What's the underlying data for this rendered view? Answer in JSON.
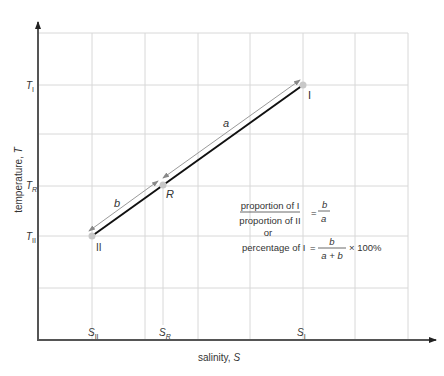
{
  "diagram": {
    "type": "TS mixing diagram",
    "x_axis_label": "salinity, ",
    "x_axis_symbol": "S",
    "y_axis_label": "temperature, ",
    "y_axis_symbol": "T",
    "colors": {
      "axis": "#555555",
      "grid": "#d8d8d8",
      "mixing_line": "#111111",
      "dimension_line": "#9a9a9a",
      "text": "#333333",
      "point": "#bbbbbb"
    },
    "points": [
      {
        "id": "I",
        "label": "I",
        "px": 303,
        "py": 85,
        "s_label": "S",
        "s_sub": "I",
        "t_label": "T",
        "t_sub": "I"
      },
      {
        "id": "R",
        "label": "R",
        "px": 163,
        "py": 185,
        "s_label": "S",
        "s_sub": "R",
        "t_label": "T",
        "t_sub": "R"
      },
      {
        "id": "II",
        "label": "II",
        "px": 92,
        "py": 236,
        "s_label": "S",
        "s_sub": "II",
        "t_label": "T",
        "t_sub": "II"
      }
    ],
    "segment_labels": {
      "a": "a",
      "b": "b"
    },
    "equations": {
      "ratio_numerator": "proportion of I",
      "ratio_denominator": "proportion of II",
      "equals": "=",
      "ratio_rhs_num": "b",
      "ratio_rhs_den": "a",
      "or": "or",
      "percentage_lhs": "percentage of I",
      "percentage_rhs_num": "b",
      "percentage_rhs_den": "a + b",
      "percentage_suffix": "× 100%"
    }
  }
}
